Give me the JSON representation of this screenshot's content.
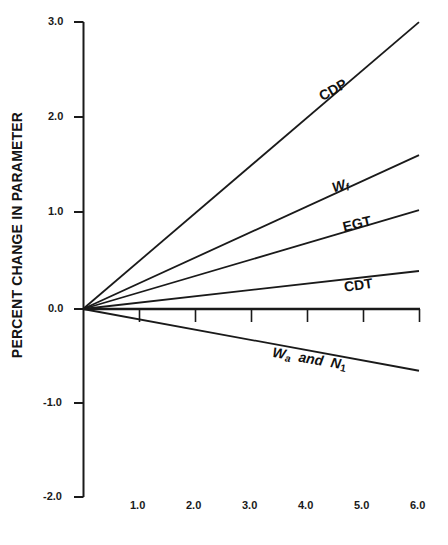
{
  "chart_data": {
    "type": "line",
    "title": "",
    "xlabel": "",
    "ylabel": "PERCENT CHANGE IN PARAMETER",
    "xlim": [
      0.0,
      6.0
    ],
    "ylim": [
      -2.0,
      3.0
    ],
    "grid": false,
    "legend": "inline-labels",
    "x_ticks": [
      "1.0",
      "2.0",
      "3.0",
      "4.0",
      "5.0",
      "6.0"
    ],
    "x_tick_values": [
      1.0,
      2.0,
      3.0,
      4.0,
      5.0,
      6.0
    ],
    "y_ticks": [
      "3.0",
      "2.0",
      "1.0",
      "0.0",
      "-1.0",
      "-2.0"
    ],
    "y_tick_values": [
      3.0,
      2.0,
      1.0,
      0.0,
      -1.0,
      -2.0
    ],
    "series": [
      {
        "name": "CDP",
        "label": "CDP",
        "x": [
          0.0,
          6.0
        ],
        "values": [
          0.0,
          3.02
        ]
      },
      {
        "name": "Wf",
        "label": "W_f",
        "x": [
          0.0,
          6.0
        ],
        "values": [
          0.0,
          1.62
        ]
      },
      {
        "name": "EGT",
        "label": "EGT",
        "x": [
          0.0,
          6.0
        ],
        "values": [
          0.0,
          1.04
        ]
      },
      {
        "name": "CDT",
        "label": "CDT",
        "x": [
          0.0,
          6.0
        ],
        "values": [
          0.0,
          0.4
        ]
      },
      {
        "name": "Wa and N1",
        "label": "W_a and N_1",
        "x": [
          0.0,
          6.0
        ],
        "values": [
          0.0,
          -0.65
        ]
      }
    ]
  },
  "axis": {
    "y_label": "PERCENT CHANGE IN PARAMETER",
    "y_tick_labels": [
      "3.0",
      "2.0",
      "1.0",
      "0.0",
      "-1.0",
      "-2.0"
    ],
    "x_tick_labels": [
      "1.0",
      "2.0",
      "3.0",
      "4.0",
      "5.0",
      "6.0"
    ]
  },
  "series_labels": {
    "cdp": "CDP",
    "wf_main": "W",
    "wf_sub": "f",
    "egt": "EGT",
    "cdt": "CDT",
    "wa_main": "W",
    "wa_sub": "a",
    "wa_and": "and",
    "n1_main": "N",
    "n1_sub": "1"
  },
  "style": {
    "line_color": "#1a1a1a",
    "axis_color": "#1a1a1a",
    "background": "#ffffff"
  }
}
